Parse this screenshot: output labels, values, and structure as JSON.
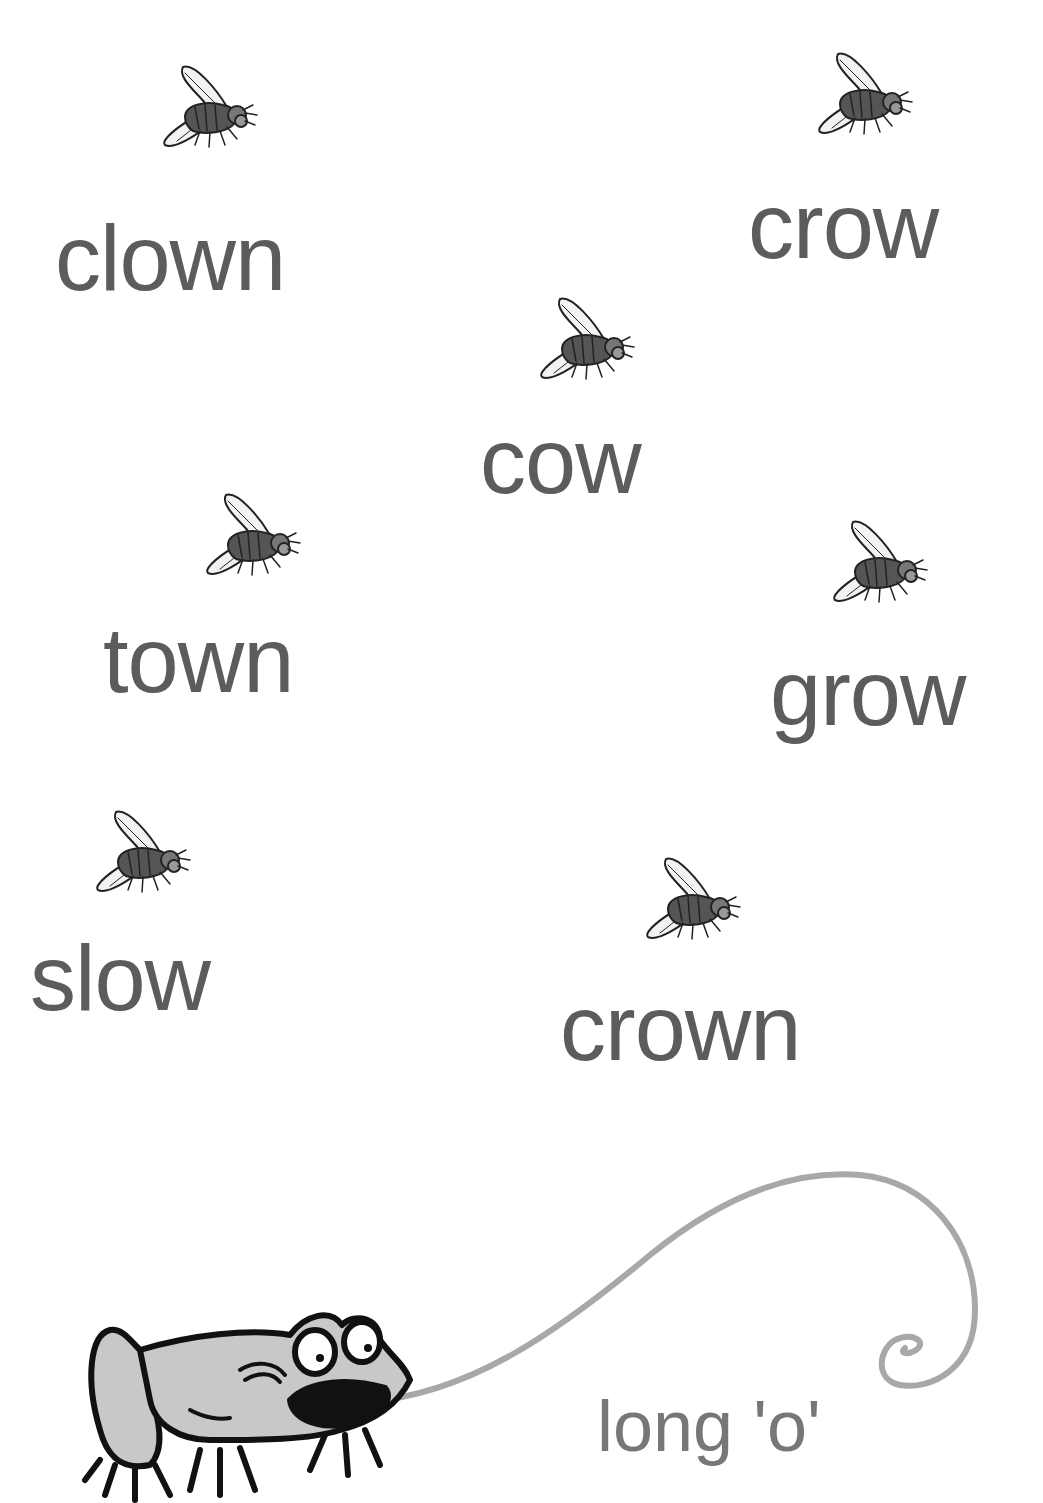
{
  "worksheet": {
    "theme": "long 'o'",
    "words": [
      {
        "text": "clown",
        "x": 55,
        "y": 212
      },
      {
        "text": "crow",
        "x": 748,
        "y": 180
      },
      {
        "text": "cow",
        "x": 480,
        "y": 415
      },
      {
        "text": "town",
        "x": 103,
        "y": 614
      },
      {
        "text": "grow",
        "x": 770,
        "y": 647
      },
      {
        "text": "slow",
        "x": 30,
        "y": 932
      },
      {
        "text": "crown",
        "x": 560,
        "y": 982
      }
    ],
    "flies": [
      {
        "x": 155,
        "y": 55
      },
      {
        "x": 810,
        "y": 42
      },
      {
        "x": 532,
        "y": 287
      },
      {
        "x": 198,
        "y": 483
      },
      {
        "x": 825,
        "y": 510
      },
      {
        "x": 88,
        "y": 800
      },
      {
        "x": 638,
        "y": 847
      }
    ],
    "colors": {
      "word_text": "#5c5c5c",
      "title_text": "#777777",
      "tongue": "#a8a8a8",
      "frog_body": "#c8c8c8"
    }
  }
}
